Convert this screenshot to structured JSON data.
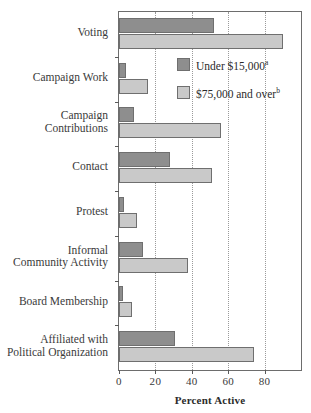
{
  "chart_data": {
    "type": "bar",
    "orientation": "horizontal",
    "title": "",
    "xlabel": "Percent Active",
    "ylabel": "",
    "xlim": [
      0,
      100
    ],
    "xticks": [
      0,
      20,
      40,
      60,
      80
    ],
    "xtick_labels": [
      "0",
      "20",
      "40",
      "60",
      "80"
    ],
    "grid": "vertical-dotted",
    "legend_position": "upper-right-inside",
    "categories": [
      "Voting",
      "Campaign Work",
      "Campaign\nContributions",
      "Contact",
      "Protest",
      "Informal\nCommunity Activity",
      "Board Membership",
      "Affiliated with\nPolitical Organization"
    ],
    "series": [
      {
        "name": "Under $15,000",
        "footnote": "a",
        "color": "#8e8e8e",
        "values": [
          52,
          4,
          8,
          28,
          3,
          13,
          2,
          31
        ]
      },
      {
        "name": "$75,000 and over",
        "footnote": "b",
        "color": "#c9c9c9",
        "values": [
          90,
          16,
          56,
          51,
          10,
          38,
          7,
          74
        ]
      }
    ]
  },
  "legend": {
    "items": [
      {
        "label": "Under $15,000",
        "sup": "a"
      },
      {
        "label": "$75,000 and over",
        "sup": "b"
      }
    ]
  },
  "axis": {
    "xlabel": "Percent Active"
  }
}
